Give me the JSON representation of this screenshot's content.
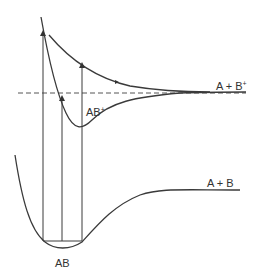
{
  "diagram": {
    "type": "potential-energy-curves",
    "curves": [
      {
        "id": "ground",
        "label": "AB",
        "asymptote_label": "A + B"
      },
      {
        "id": "ion-bound",
        "label": "AB",
        "label_sup": "+",
        "asymptote_label": "A + B",
        "asymptote_sup": "+"
      },
      {
        "id": "ion-repulsive",
        "label": ""
      }
    ],
    "labels": {
      "ab_plus": "AB",
      "ab_plus_sup": "+",
      "a_b_plus": "A + B",
      "a_b_plus_sup": "+",
      "a_b": "A + B",
      "ab": "AB"
    },
    "dashed_line": "ionization threshold",
    "transitions": 3,
    "colors": {
      "line": "#3a3a3a",
      "dash": "#555555"
    }
  }
}
